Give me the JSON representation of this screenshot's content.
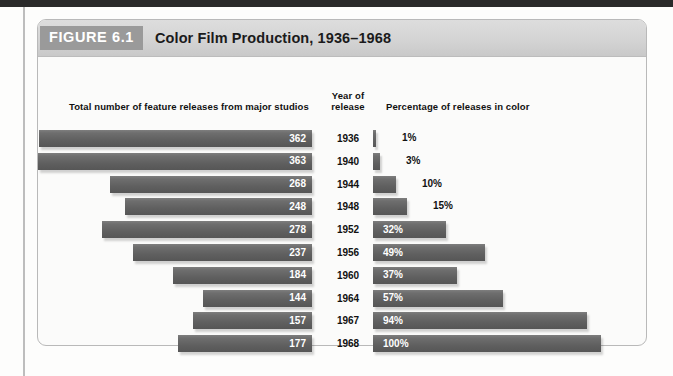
{
  "figure": {
    "tag": "FIGURE 6.1",
    "title": "Color Film Production, 1936–1968",
    "headers": {
      "left": "Total number of feature releases from major studios",
      "year_line1": "Year of",
      "year_line2": "release",
      "right": "Percentage of releases in color"
    }
  },
  "colors": {
    "bar": "#656565",
    "tag_background": "#9a9a9a",
    "header_background": "#d6d6d6",
    "card_border": "#b9b9b9",
    "page_band": "#2a2a2a"
  },
  "chart_data": {
    "type": "bar",
    "title": "Color Film Production, 1936–1968",
    "xlabel": "",
    "ylabel": "Year of release",
    "orientation": "horizontal",
    "grid": false,
    "legend": "none",
    "categories": [
      "1936",
      "1940",
      "1944",
      "1948",
      "1952",
      "1956",
      "1960",
      "1964",
      "1967",
      "1968"
    ],
    "series": [
      {
        "name": "Total number of feature releases from major studios",
        "units": "releases",
        "xlim": [
          0,
          363
        ],
        "values": [
          362,
          363,
          268,
          248,
          278,
          237,
          184,
          144,
          157,
          177
        ],
        "labels": [
          "362",
          "363",
          "268",
          "248",
          "278",
          "237",
          "184",
          "144",
          "157",
          "177"
        ]
      },
      {
        "name": "Percentage of releases in color",
        "units": "percent",
        "xlim": [
          0,
          100
        ],
        "values": [
          1,
          3,
          10,
          15,
          32,
          49,
          37,
          57,
          94,
          100
        ],
        "labels": [
          "1%",
          "3%",
          "10%",
          "15%",
          "32%",
          "49%",
          "37%",
          "57%",
          "94%",
          "100%"
        ]
      }
    ],
    "rows": [
      {
        "year": "1936",
        "releases": 362,
        "releases_label": "362",
        "percent": 1,
        "percent_label": "1%",
        "percent_label_inside": false
      },
      {
        "year": "1940",
        "releases": 363,
        "releases_label": "363",
        "percent": 3,
        "percent_label": "3%",
        "percent_label_inside": false
      },
      {
        "year": "1944",
        "releases": 268,
        "releases_label": "268",
        "percent": 10,
        "percent_label": "10%",
        "percent_label_inside": false
      },
      {
        "year": "1948",
        "releases": 248,
        "releases_label": "248",
        "percent": 15,
        "percent_label": "15%",
        "percent_label_inside": false
      },
      {
        "year": "1952",
        "releases": 278,
        "releases_label": "278",
        "percent": 32,
        "percent_label": "32%",
        "percent_label_inside": true
      },
      {
        "year": "1956",
        "releases": 237,
        "releases_label": "237",
        "percent": 49,
        "percent_label": "49%",
        "percent_label_inside": true
      },
      {
        "year": "1960",
        "releases": 184,
        "releases_label": "184",
        "percent": 37,
        "percent_label": "37%",
        "percent_label_inside": true
      },
      {
        "year": "1964",
        "releases": 144,
        "releases_label": "144",
        "percent": 57,
        "percent_label": "57%",
        "percent_label_inside": true
      },
      {
        "year": "1967",
        "releases": 157,
        "releases_label": "157",
        "percent": 94,
        "percent_label": "94%",
        "percent_label_inside": true
      },
      {
        "year": "1968",
        "releases": 177,
        "releases_label": "177",
        "percent": 100,
        "percent_label": "100%",
        "percent_label_inside": true
      }
    ]
  }
}
